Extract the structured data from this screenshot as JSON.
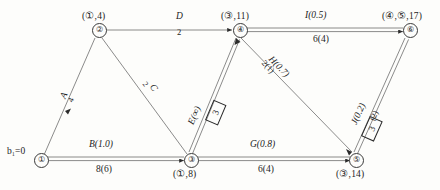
{
  "diagram": {
    "type": "network-flow-labeling",
    "title": "",
    "source_label": "b₁=0",
    "nodes": [
      {
        "id": "1",
        "glyph": "①",
        "label": "",
        "x": 40,
        "y": 159
      },
      {
        "id": "2",
        "glyph": "②",
        "label": "(①,4)",
        "x": 98,
        "y": 29
      },
      {
        "id": "3",
        "glyph": "③",
        "label": "(①,8)",
        "x": 190,
        "y": 159
      },
      {
        "id": "4",
        "glyph": "④",
        "label": "(③,11)",
        "x": 239,
        "y": 29
      },
      {
        "id": "5",
        "glyph": "⑤",
        "label": "(③,14)",
        "x": 355,
        "y": 159
      },
      {
        "id": "6",
        "glyph": "⑥",
        "label": "(④,⑤,17)",
        "x": 409,
        "y": 29
      }
    ],
    "edges": [
      {
        "id": "A",
        "name": "A",
        "capacity": "",
        "from": "1",
        "to": "2",
        "flow_box": ""
      },
      {
        "id": "B",
        "name": "B(1.0)",
        "capacity": "8(6)",
        "from": "1",
        "to": "3",
        "flow_box": ""
      },
      {
        "id": "C",
        "name": "C",
        "capacity": "2",
        "from": "2",
        "to": "3",
        "flow_box": ""
      },
      {
        "id": "D",
        "name": "D",
        "capacity": "2",
        "from": "2",
        "to": "4",
        "flow_box": ""
      },
      {
        "id": "E",
        "name": "E(∞)",
        "capacity": "",
        "from": "3",
        "to": "4",
        "flow_box": "3"
      },
      {
        "id": "G",
        "name": "G(0.8)",
        "capacity": "6(4)",
        "from": "3",
        "to": "5",
        "flow_box": ""
      },
      {
        "id": "H",
        "name": "H(0.7)",
        "capacity": "2(1)",
        "from": "4",
        "to": "5",
        "flow_box": ""
      },
      {
        "id": "I",
        "name": "I(0.5)",
        "capacity": "6(4)",
        "from": "4",
        "to": "6",
        "flow_box": ""
      },
      {
        "id": "J",
        "name": "J(0.2)",
        "capacity": "(2)",
        "from": "5",
        "to": "6",
        "flow_box": "3"
      }
    ],
    "edge_labels": {
      "A_name": "A",
      "A_cap": "4",
      "B_name": "B(1.0)",
      "B_cap": "8(6)",
      "C_name": "C",
      "C_cap": "2",
      "D_name": "D",
      "D_cap": "2",
      "E_name": "E(∞)",
      "E_box": "3",
      "G_name": "G(0.8)",
      "G_cap": "6(4)",
      "H_name": "H(0.7)",
      "H_cap": "2(1)",
      "I_name": "I(0.5)",
      "I_cap": "6(4)",
      "J_name": "J(0.2)",
      "J_cap": "(2)",
      "J_box": "3"
    }
  }
}
